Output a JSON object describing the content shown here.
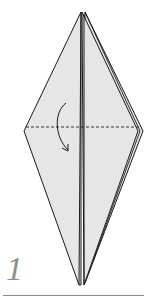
{
  "step": {
    "number": "1",
    "instruction_graphic": "valley-fold-down-along-horizontal-dashed-line"
  },
  "colors": {
    "paper_fill": "#e6e6e6",
    "outline": "#1a1a1a",
    "fold_line": "#333333",
    "step_number": "#8f8f8f",
    "rule": "#8a8a8a"
  },
  "icons": {
    "fold_arrow": "curved-arrow-down-icon",
    "fold_line": "dashed-valley-fold-line"
  }
}
